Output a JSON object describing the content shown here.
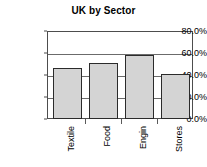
{
  "chart_data": {
    "type": "bar",
    "title": "UK by Sector",
    "xlabel": "",
    "ylabel": "",
    "categories": [
      "Textile",
      "Food",
      "Engin",
      "Stores"
    ],
    "values": [
      46.0,
      51.0,
      58.0,
      41.0
    ],
    "value_labels": [
      "46.0%",
      "51.0%",
      "58.0%",
      "41.0%"
    ],
    "ylim": [
      0,
      80
    ],
    "ytick_values": [
      0,
      20,
      40,
      60,
      80
    ],
    "ytick_labels": [
      "0.0%",
      "20.0%",
      "40.0%",
      "60.0%",
      "80.0%"
    ],
    "grid": true,
    "legend": false,
    "legend_position": "none",
    "bar_fill_color": "#d4d4d4",
    "bar_border_color": "#2b2b2b",
    "gridline_color": "#6b6b6b",
    "frame_color": "#4d4d4d",
    "background_color": "#ffffff",
    "text_color": "#000000"
  }
}
